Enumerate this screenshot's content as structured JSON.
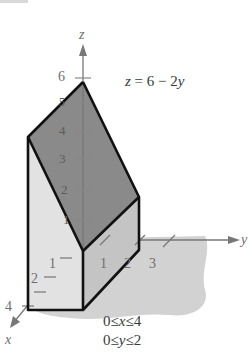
{
  "figure": {
    "equation": {
      "lhs": "z",
      "rhs_text": " = 6 − 2",
      "rhs_var": "y"
    },
    "constraints": [
      {
        "lo": "0",
        "op": "≤",
        "var": "x",
        "hi": "4"
      },
      {
        "lo": "0",
        "op": "≤",
        "var": "y",
        "hi": "2"
      }
    ],
    "axes": {
      "x": {
        "label": "x",
        "ticks": [
          "1",
          "2",
          "",
          "4"
        ]
      },
      "y": {
        "label": "y",
        "ticks": [
          "1",
          "2",
          "3"
        ]
      },
      "z": {
        "label": "z",
        "ticks": [
          "1",
          "2",
          "3",
          "4",
          "5",
          "6"
        ]
      }
    },
    "colors": {
      "top_face": "#8a8a8a",
      "left_face": "#e2e2e2",
      "right_face": "#c4c4c4",
      "shadow": "#d2d2d2",
      "edge": "#111111",
      "axis": "#777777"
    }
  }
}
